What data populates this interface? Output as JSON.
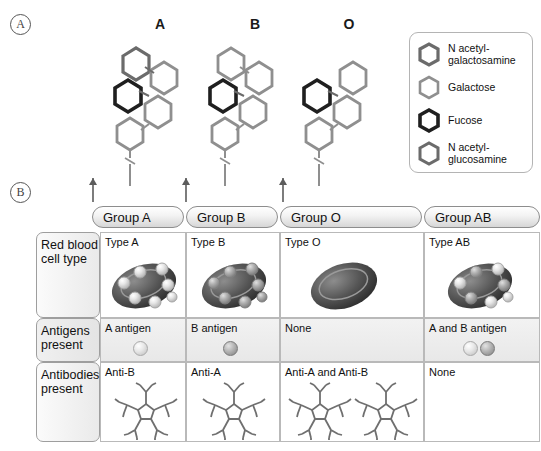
{
  "panels": {
    "a_label": "A",
    "b_label": "B"
  },
  "glycans": {
    "structures": [
      {
        "title": "A",
        "blood_group": "A",
        "terminal_sugar": "N acetyl-galactosamine",
        "sugars": [
          "N acetyl-galactosamine",
          "Galactose",
          "Fucose",
          "N acetyl-glucosamine"
        ]
      },
      {
        "title": "B",
        "blood_group": "B",
        "terminal_sugar": "Galactose",
        "sugars": [
          "Galactose",
          "Galactose",
          "Fucose",
          "N acetyl-glucosamine"
        ]
      },
      {
        "title": "O",
        "blood_group": "O",
        "terminal_sugar": "None",
        "sugars": [
          "Galactose",
          "Fucose",
          "N acetyl-glucosamine"
        ]
      }
    ]
  },
  "legend": {
    "items": [
      {
        "name": "N acetyl-galactosamine",
        "line1": "N acetyl-",
        "line2": "galactosamine",
        "style": "medium"
      },
      {
        "name": "Galactose",
        "line1": "Galactose",
        "line2": "",
        "style": "light"
      },
      {
        "name": "Fucose",
        "line1": "Fucose",
        "line2": "",
        "style": "dark"
      },
      {
        "name": "N acetyl-glucosamine",
        "line1": "N acetyl-",
        "line2": "glucosamine",
        "style": "medium"
      }
    ]
  },
  "table": {
    "columns": [
      {
        "header": "Group A"
      },
      {
        "header": "Group B"
      },
      {
        "header": "Group O"
      },
      {
        "header": "Group AB"
      }
    ],
    "rows": [
      {
        "label_line1": "Red blood",
        "label_line2": "cell type",
        "cells": [
          {
            "text": "Type A",
            "antigens": "a"
          },
          {
            "text": "Type B",
            "antigens": "b"
          },
          {
            "text": "Type O",
            "antigens": "none"
          },
          {
            "text": "Type AB",
            "antigens": "ab"
          }
        ]
      },
      {
        "label_line1": "Antigens",
        "label_line2": "present",
        "cells": [
          {
            "text": "A antigen",
            "dots": "a"
          },
          {
            "text": "B antigen",
            "dots": "b"
          },
          {
            "text": "None",
            "dots": "none"
          },
          {
            "text": "A and B antigen",
            "dots": "ab"
          }
        ]
      },
      {
        "label_line1": "Antibodies",
        "label_line2": "present",
        "cells": [
          {
            "text": "Anti-B",
            "antibodies": 1
          },
          {
            "text": "Anti-A",
            "antibodies": 1
          },
          {
            "text": "Anti-A and Anti-B",
            "antibodies": 2
          },
          {
            "text": "None",
            "antibodies": 0
          }
        ]
      }
    ]
  },
  "colors": {
    "hex_light": "#9a9a9a",
    "hex_medium": "#6b6b6b",
    "hex_dark": "#1f1f1f",
    "cell_body": "#4a4a4a",
    "border": "#b9b9b9"
  }
}
